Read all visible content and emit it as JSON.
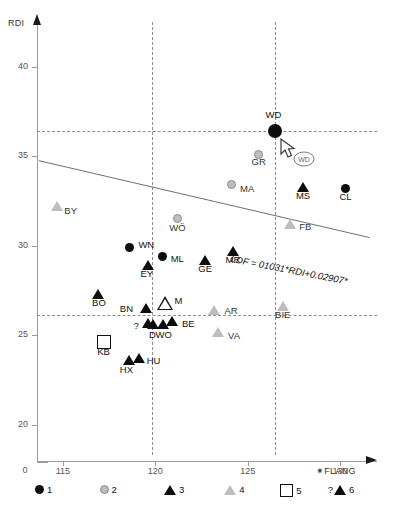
{
  "chart_data": {
    "type": "scatter",
    "title": "",
    "xlabel": "FLANG",
    "ylabel": "RDI",
    "xlim": [
      113.6,
      132.0
    ],
    "ylim": [
      18.3,
      42.5
    ],
    "xticks": [
      "115",
      "120",
      "125",
      "130"
    ],
    "yticks": [
      "20",
      "25",
      "30",
      "35",
      "40"
    ],
    "axis_break_label": "0",
    "grid": false,
    "legend_position": "bottom",
    "regression_label": "LDF = 01031*RDI+0.02907*",
    "regression_endpoints": [
      {
        "x": 113.7,
        "y": 34.75
      },
      {
        "x": 131.6,
        "y": 30.45
      }
    ],
    "reference_lines": [
      {
        "orientation": "vertical",
        "value": 119.8
      },
      {
        "orientation": "vertical",
        "value": 126.5
      },
      {
        "orientation": "horizontal",
        "value": 36.4
      },
      {
        "orientation": "horizontal",
        "value": 26.1
      }
    ],
    "legend": [
      {
        "key": "1",
        "marker": "circle-filled",
        "color": "#0d0d0d"
      },
      {
        "key": "2",
        "marker": "circle-grey",
        "color": "#bdbdbd"
      },
      {
        "key": "3",
        "marker": "triangle-filled",
        "color": "#0d0d0d"
      },
      {
        "key": "4",
        "marker": "triangle-grey",
        "color": "#bdbdbd"
      },
      {
        "key": "5",
        "marker": "square-open",
        "color": "#ffffff"
      },
      {
        "key": "6",
        "marker": "question-triangle",
        "color": "#0d0d0d"
      }
    ],
    "points": [
      {
        "label": "WD",
        "x": 126.5,
        "y": 36.4,
        "group": 1,
        "size": "large"
      },
      {
        "label": "GR",
        "x": 125.6,
        "y": 35.1,
        "group": 2
      },
      {
        "label": "CL",
        "x": 130.3,
        "y": 33.2,
        "group": 1
      },
      {
        "label": "MS",
        "x": 128.0,
        "y": 33.3,
        "group": 3
      },
      {
        "label": "MA",
        "x": 124.1,
        "y": 33.4,
        "group": 2
      },
      {
        "label": "BY",
        "x": 114.7,
        "y": 32.2,
        "group": 4
      },
      {
        "label": "WÖ",
        "x": 121.2,
        "y": 31.5,
        "group": 2
      },
      {
        "label": "FB",
        "x": 127.3,
        "y": 31.2,
        "group": 4
      },
      {
        "label": "WN",
        "x": 118.6,
        "y": 29.9,
        "group": 1
      },
      {
        "label": "ML",
        "x": 120.4,
        "y": 29.4,
        "group": 1
      },
      {
        "label": "MR",
        "x": 124.2,
        "y": 29.7,
        "group": 3
      },
      {
        "label": "GE",
        "x": 122.7,
        "y": 29.2,
        "group": 3
      },
      {
        "label": "EY",
        "x": 119.6,
        "y": 28.9,
        "group": 3
      },
      {
        "label": "BO",
        "x": 116.9,
        "y": 27.3,
        "group": 3
      },
      {
        "label": "M",
        "x": 120.5,
        "y": 26.8,
        "group": 6
      },
      {
        "label": "BN",
        "x": 119.5,
        "y": 26.5,
        "group": 3
      },
      {
        "label": "AR",
        "x": 123.2,
        "y": 26.4,
        "group": 4
      },
      {
        "label": "BIE",
        "x": 126.9,
        "y": 26.6,
        "group": 4
      },
      {
        "label": "?",
        "x": 119.6,
        "y": 25.7,
        "group": 3
      },
      {
        "label": "D",
        "x": 119.9,
        "y": 25.6,
        "group": 3
      },
      {
        "label": "WO",
        "x": 120.4,
        "y": 25.6,
        "group": 3
      },
      {
        "label": "BE",
        "x": 120.9,
        "y": 25.8,
        "group": 3
      },
      {
        "label": "VA",
        "x": 123.4,
        "y": 25.2,
        "group": 4
      },
      {
        "label": "KB",
        "x": 117.2,
        "y": 24.6,
        "group": 5
      },
      {
        "label": "HX",
        "x": 118.6,
        "y": 23.6,
        "group": 3
      },
      {
        "label": "HU",
        "x": 119.1,
        "y": 23.7,
        "group": 3
      }
    ],
    "cursor": {
      "tooltip": "WD",
      "x": 126.9,
      "y": 35.8
    }
  }
}
